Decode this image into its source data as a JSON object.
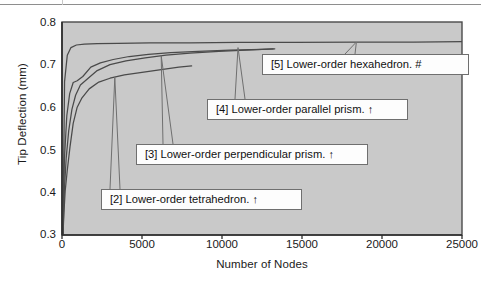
{
  "chart_data": {
    "type": "line",
    "title": "",
    "xlabel": "Number of Nodes",
    "ylabel": "Tip Deflection (mm)",
    "xlim": [
      0,
      25000
    ],
    "ylim": [
      0.3,
      0.8
    ],
    "xticks": [
      "0",
      "5000",
      "10000",
      "15000",
      "20000",
      "25000"
    ],
    "xtick_values": [
      0,
      5000,
      10000,
      15000,
      20000,
      25000
    ],
    "yticks": [
      "0.3",
      "0.4",
      "0.5",
      "0.6",
      "0.7",
      "0.8"
    ],
    "ytick_values": [
      0.3,
      0.4,
      0.5,
      0.6,
      0.7,
      0.8
    ],
    "grid": false,
    "legend_position": "inline-callouts",
    "plot_background": "#c9c9c9",
    "line_color": "#4a4a4a",
    "series": [
      {
        "name": "[2] Lower-order tetrahedron.",
        "marker": "↑",
        "callout": "[2] Lower-order tetrahedron. ↑",
        "points": [
          [
            60,
            0.3
          ],
          [
            120,
            0.352
          ],
          [
            200,
            0.404
          ],
          [
            330,
            0.452
          ],
          [
            500,
            0.507
          ],
          [
            700,
            0.562
          ],
          [
            950,
            0.6
          ],
          [
            1250,
            0.622
          ],
          [
            1700,
            0.643
          ],
          [
            2300,
            0.659
          ],
          [
            3000,
            0.668
          ],
          [
            3900,
            0.676
          ],
          [
            5000,
            0.682
          ],
          [
            6200,
            0.688
          ],
          [
            7300,
            0.694
          ],
          [
            8100,
            0.697
          ]
        ]
      },
      {
        "name": "[3] Lower-order perpendicular prism.",
        "marker": "↑",
        "callout": "[3] Lower-order perpendicular prism. ↑",
        "points": [
          [
            60,
            0.3
          ],
          [
            140,
            0.4
          ],
          [
            260,
            0.48
          ],
          [
            420,
            0.545
          ],
          [
            620,
            0.595
          ],
          [
            850,
            0.628
          ],
          [
            1150,
            0.652
          ],
          [
            1600,
            0.667
          ],
          [
            2200,
            0.686
          ],
          [
            3000,
            0.7
          ],
          [
            4000,
            0.709
          ],
          [
            5200,
            0.716
          ],
          [
            6500,
            0.722
          ],
          [
            8000,
            0.727
          ],
          [
            9800,
            0.731
          ],
          [
            11500,
            0.734
          ],
          [
            13200,
            0.737
          ]
        ]
      },
      {
        "name": "[4] Lower-order parallel prism.",
        "marker": "↑",
        "callout": "[4] Lower-order parallel prism. ↑",
        "points": [
          [
            60,
            0.3
          ],
          [
            150,
            0.478
          ],
          [
            300,
            0.58
          ],
          [
            480,
            0.632
          ],
          [
            700,
            0.658
          ],
          [
            950,
            0.662
          ],
          [
            1300,
            0.672
          ],
          [
            1800,
            0.694
          ],
          [
            2400,
            0.704
          ],
          [
            3200,
            0.712
          ],
          [
            4200,
            0.719
          ],
          [
            5400,
            0.724
          ],
          [
            6800,
            0.728
          ],
          [
            8500,
            0.731
          ],
          [
            10500,
            0.734
          ],
          [
            12500,
            0.736
          ],
          [
            13300,
            0.737
          ]
        ]
      },
      {
        "name": "[5] Lower-order hexahedron.",
        "marker": "#",
        "callout": "[5] Lower-order hexahedron. #",
        "points": [
          [
            60,
            0.3
          ],
          [
            160,
            0.66
          ],
          [
            330,
            0.722
          ],
          [
            560,
            0.74
          ],
          [
            900,
            0.746
          ],
          [
            1400,
            0.748
          ],
          [
            2200,
            0.749
          ],
          [
            3500,
            0.75
          ],
          [
            5500,
            0.751
          ],
          [
            8000,
            0.751
          ],
          [
            11000,
            0.752
          ],
          [
            14500,
            0.752
          ],
          [
            18500,
            0.753
          ],
          [
            22000,
            0.753
          ],
          [
            25000,
            0.754
          ]
        ]
      }
    ],
    "callouts": [
      {
        "id": "callout-2",
        "label": "[2] Lower-order tetrahedron. ↑",
        "box_x": 101,
        "box_y": 189,
        "box_w": 201,
        "box_h": 21,
        "anchor_x": 3300,
        "anchor_y": 0.67,
        "leader_from_x": 115
      },
      {
        "id": "callout-3",
        "label": "[3] Lower-order perpendicular prism. ↑",
        "box_x": 136,
        "box_y": 144,
        "box_w": 232,
        "box_h": 21,
        "anchor_x": 6200,
        "anchor_y": 0.721,
        "leader_from_x": 168
      },
      {
        "id": "callout-4",
        "label": "[4] Lower-order parallel prism. ↑",
        "box_x": 207,
        "box_y": 99,
        "box_w": 201,
        "box_h": 21,
        "anchor_x": 11000,
        "anchor_y": 0.74,
        "leader_from_x": 240
      },
      {
        "id": "callout-5",
        "label": "[5] Lower-order hexahedron. #",
        "box_x": 262,
        "box_y": 54,
        "box_w": 207,
        "box_h": 21,
        "anchor_x": 18400,
        "anchor_y": 0.753,
        "leader_from_x": 350
      }
    ]
  },
  "axes": {
    "ylabel": "Tip Deflection (mm)",
    "xlabel": "Number of Nodes",
    "yticks": [
      "0.8",
      "0.7",
      "0.6",
      "0.5",
      "0.4",
      "0.3"
    ],
    "xticks": [
      "0",
      "5000",
      "10000",
      "15000",
      "20000",
      "25000"
    ]
  }
}
